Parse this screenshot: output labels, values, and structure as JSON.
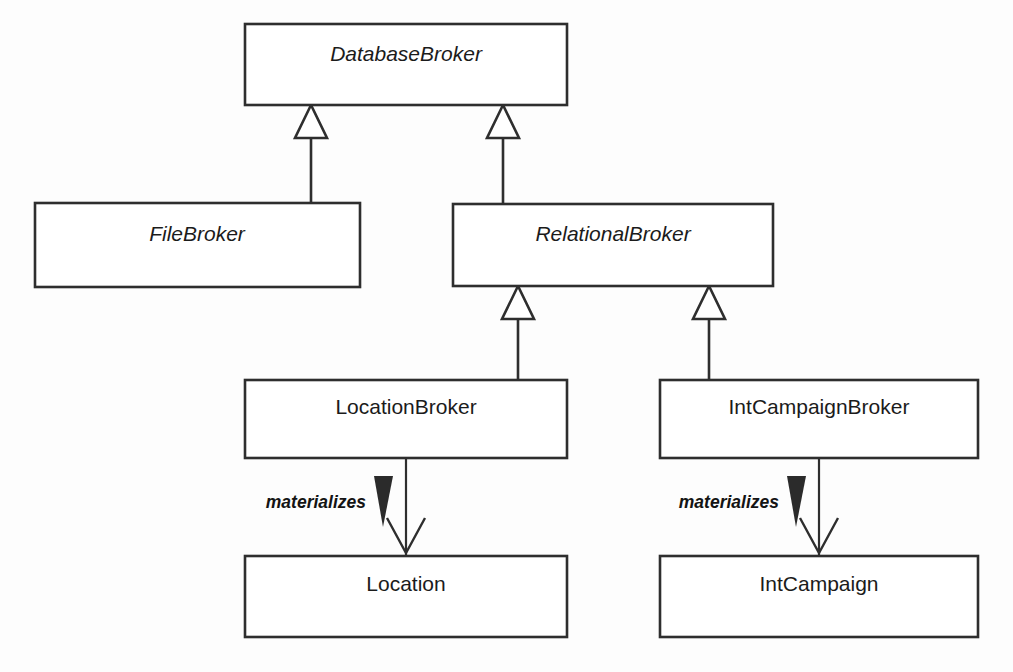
{
  "diagram": {
    "kind": "uml-class-diagram",
    "background_color": "#fdfdfd",
    "line_color": "#2e2e2e",
    "text_color": "#1b1b1b",
    "fill_color": "#ffffff",
    "marker_fill_color": "#2b2b2b",
    "width": 1013,
    "height": 672,
    "classes": [
      {
        "id": "database-broker",
        "name": "DatabaseBroker",
        "abstract": true,
        "x": 245,
        "y": 24,
        "w": 322,
        "h": 81,
        "label_x": 406,
        "label_y": 61
      },
      {
        "id": "file-broker",
        "name": "FileBroker",
        "abstract": true,
        "x": 35,
        "y": 203,
        "w": 325,
        "h": 84,
        "label_x": 197,
        "label_y": 241
      },
      {
        "id": "relational-broker",
        "name": "RelationalBroker",
        "abstract": true,
        "x": 453,
        "y": 204,
        "w": 320,
        "h": 82,
        "label_x": 613,
        "label_y": 241
      },
      {
        "id": "location-broker",
        "name": "LocationBroker",
        "abstract": false,
        "x": 245,
        "y": 380,
        "w": 322,
        "h": 78,
        "label_x": 406,
        "label_y": 414
      },
      {
        "id": "int-campaign-broker",
        "name": "IntCampaignBroker",
        "abstract": false,
        "x": 660,
        "y": 380,
        "w": 318,
        "h": 78,
        "label_x": 819,
        "label_y": 414
      },
      {
        "id": "location",
        "name": "Location",
        "abstract": false,
        "x": 245,
        "y": 556,
        "w": 322,
        "h": 81,
        "label_x": 406,
        "label_y": 591
      },
      {
        "id": "int-campaign",
        "name": "IntCampaign",
        "abstract": false,
        "x": 660,
        "y": 556,
        "w": 318,
        "h": 81,
        "label_x": 819,
        "label_y": 591
      }
    ],
    "generalizations": [
      {
        "id": "gen-file-to-database",
        "from": "FileBroker",
        "to": "DatabaseBroker",
        "triangle": "311,105 295,138 327,138",
        "stem": "M 311 138 L 311 203"
      },
      {
        "id": "gen-relational-to-database",
        "from": "RelationalBroker",
        "to": "DatabaseBroker",
        "triangle": "503,105 487,138 519,138",
        "stem": "M 503 138 L 503 204"
      },
      {
        "id": "gen-location-broker-to-relational",
        "from": "LocationBroker",
        "to": "RelationalBroker",
        "triangle": "518,286 502,319 534,319",
        "stem": "M 518 319 L 518 380"
      },
      {
        "id": "gen-int-campaign-broker-to-relational",
        "from": "IntCampaignBroker",
        "to": "RelationalBroker",
        "triangle": "709,286 693,319 725,319",
        "stem": "M 709 319 L 709 380"
      }
    ],
    "dependencies": [
      {
        "id": "dep-location-broker-materializes-location",
        "label": "materializes",
        "from": "LocationBroker",
        "to": "Location",
        "stem": "M 406 458 L 406 556",
        "arrowhead": "M 387 518 L 406 553 L 425 518",
        "marker": "374,476 393,476 383,527",
        "label_x": 366,
        "label_y": 508
      },
      {
        "id": "dep-int-campaign-broker-materializes-int-campaign",
        "label": "materializes",
        "from": "IntCampaignBroker",
        "to": "IntCampaign",
        "stem": "M 819 458 L 819 556",
        "arrowhead": "M 800 518 L 819 553 L 838 518",
        "marker": "787,476 806,476 796,527",
        "label_x": 779,
        "label_y": 508
      }
    ]
  }
}
